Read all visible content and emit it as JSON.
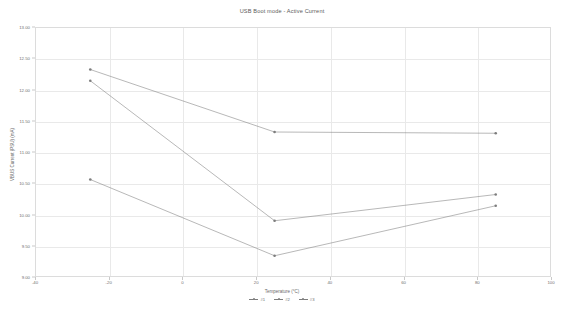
{
  "chart_data": {
    "type": "line",
    "title": "USB Boot mode - Active Current",
    "xlabel": "Temperature (°C)",
    "ylabel": "VBUS Current (PSU) (mA)",
    "xlim": [
      -40,
      100
    ],
    "ylim": [
      9.0,
      13.0
    ],
    "grid": true,
    "legend_position": "bottom",
    "x": [
      -25,
      25,
      85
    ],
    "xticks": [
      -40,
      -20,
      0,
      20,
      40,
      60,
      80,
      100
    ],
    "xtick_labels": [
      "-40",
      "-20",
      "0",
      "20",
      "40",
      "60",
      "80",
      "100"
    ],
    "yticks": [
      9.0,
      9.5,
      10.0,
      10.5,
      11.0,
      11.5,
      12.0,
      12.5,
      13.0
    ],
    "ytick_labels": [
      "9.00",
      "9.50",
      "10.00",
      "10.50",
      "11.00",
      "11.50",
      "12.00",
      "12.50",
      "13.00"
    ],
    "series": [
      {
        "name": "#1",
        "color": "#7d7d7d",
        "values": [
          12.32,
          11.32,
          11.3
        ]
      },
      {
        "name": "#2",
        "color": "#7d7d7d",
        "values": [
          12.14,
          9.9,
          10.32
        ]
      },
      {
        "name": "#3",
        "color": "#7d7d7d",
        "values": [
          10.56,
          9.34,
          10.14
        ]
      }
    ]
  },
  "legend": {
    "items": [
      {
        "label": "#1"
      },
      {
        "label": "#2"
      },
      {
        "label": "#3"
      }
    ]
  }
}
